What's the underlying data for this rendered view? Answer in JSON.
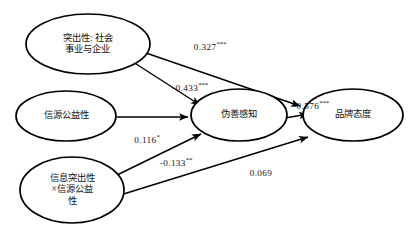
{
  "diagram": {
    "type": "path-analysis-structural-equation-model",
    "background_color": "#ffffff",
    "line_color": "#000000",
    "nodes": [
      {
        "id": "salience",
        "label": "突出性: 社会\n事业与企业",
        "cx": 88,
        "cy": 44,
        "rx": 62,
        "ry": 30
      },
      {
        "id": "source_publicness",
        "label": "信源公益性",
        "cx": 66,
        "cy": 116,
        "rx": 50,
        "ry": 25
      },
      {
        "id": "interaction",
        "label": "信息突出性\n×信源公益\n性",
        "cx": 72,
        "cy": 190,
        "rx": 52,
        "ry": 33
      },
      {
        "id": "hypocrisy_perception",
        "label": "伪善感知",
        "cx": 239,
        "cy": 115,
        "rx": 48,
        "ry": 26
      },
      {
        "id": "brand_attitude",
        "label": "品牌态度",
        "cx": 353,
        "cy": 115,
        "rx": 50,
        "ry": 26
      }
    ],
    "edges": [
      {
        "id": "salience-to-brand-attitude",
        "from": "salience",
        "to": "brand_attitude",
        "coefficient": "0.327",
        "significance": "***",
        "label_x": 210,
        "label_y": 46
      },
      {
        "id": "salience-to-hypocrisy",
        "from": "salience",
        "to": "hypocrisy_perception",
        "coefficient": "-0.433",
        "significance": "***",
        "label_x": 190,
        "label_y": 87
      },
      {
        "id": "source-publicness-to-hypocrisy",
        "from": "source_publicness",
        "to": "hypocrisy_perception",
        "coefficient": "0.116",
        "significance": "*",
        "label_x": 147,
        "label_y": 139
      },
      {
        "id": "interaction-to-hypocrisy",
        "from": "interaction",
        "to": "hypocrisy_perception",
        "coefficient": "-0.133",
        "significance": "**",
        "label_x": 176,
        "label_y": 162
      },
      {
        "id": "interaction-to-brand-attitude",
        "from": "interaction",
        "to": "brand_attitude",
        "coefficient": "0.069",
        "significance": "",
        "label_x": 261,
        "label_y": 172
      },
      {
        "id": "hypocrisy-to-brand-attitude",
        "from": "hypocrisy_perception",
        "to": "brand_attitude",
        "coefficient": "-0.576",
        "significance": "***",
        "label_x": 311,
        "label_y": 105
      }
    ]
  }
}
